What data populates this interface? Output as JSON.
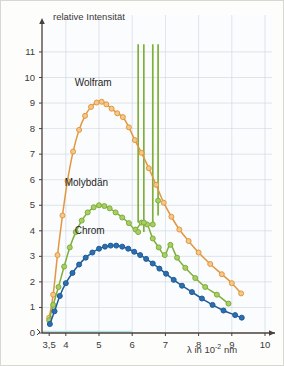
{
  "figure": {
    "background_color": "#fdfdfb",
    "border_color": "#d8d8d2"
  },
  "axes": {
    "y_title": "relative Intensität",
    "x_title_prefix": "λ in 10",
    "x_title_exponent": "-2",
    "x_title_suffix": "nm",
    "y_ticks": [
      "0",
      "1",
      "2",
      "3",
      "4",
      "5",
      "6",
      "7",
      "8",
      "9",
      "10",
      "11"
    ],
    "x_ticks": [
      "3,5",
      "4",
      "5",
      "6",
      "7",
      "8",
      "9",
      "10"
    ],
    "axis_color": "#4a3f3a",
    "grid_color": "#c9d6e0",
    "baseline_color": "#aee6e6"
  },
  "chart_data": {
    "type": "line",
    "title": "",
    "xlabel": "λ in 10^-2 nm",
    "ylabel": "relative Intensität",
    "xlim": [
      3.2,
      10.3
    ],
    "ylim": [
      0,
      11.3
    ],
    "grid": true,
    "legend": "inline-annotations",
    "annotations": [
      {
        "text": "Wolfram",
        "x": 5.05,
        "y": 9.75,
        "color": "#1f1f1f"
      },
      {
        "text": "Molybdän",
        "x": 4.75,
        "y": 5.85,
        "color": "#1f1f1f"
      },
      {
        "text": "Chrom",
        "x": 5.05,
        "y": 3.95,
        "color": "#1f1f1f"
      }
    ],
    "series": [
      {
        "name": "Wolfram",
        "color": "#e2973f",
        "marker": "circle",
        "marker_fill": "#f4c88a",
        "x": [
          3.5,
          3.62,
          3.75,
          3.9,
          4.05,
          4.22,
          4.4,
          4.58,
          4.76,
          4.93,
          5.08,
          5.22,
          5.38,
          5.55,
          5.72,
          5.9,
          6.08,
          6.28,
          6.5,
          6.72,
          6.95,
          7.18,
          7.42,
          7.7,
          8.0,
          8.35,
          8.7,
          9.0,
          9.28
        ],
        "y": [
          0.6,
          1.5,
          3.05,
          4.6,
          5.95,
          7.1,
          7.95,
          8.5,
          8.85,
          9.02,
          9.05,
          8.95,
          8.78,
          8.6,
          8.45,
          8.05,
          7.55,
          7.05,
          6.45,
          5.8,
          5.1,
          4.55,
          4.05,
          3.6,
          3.15,
          2.7,
          2.3,
          1.95,
          1.55
        ]
      },
      {
        "name": "Molybdän",
        "color": "#7fae3a",
        "marker": "circle",
        "marker_fill": "#a8cf63",
        "x": [
          3.5,
          3.62,
          3.78,
          3.95,
          4.12,
          4.3,
          4.48,
          4.66,
          4.84,
          5.0,
          5.16,
          5.32,
          5.5,
          5.7,
          5.9,
          6.1,
          6.28,
          6.45,
          6.62,
          6.8,
          6.98,
          7.15,
          7.35,
          7.6,
          7.9,
          8.2,
          8.55,
          8.9
        ],
        "y": [
          0.5,
          1.1,
          1.8,
          2.6,
          3.35,
          3.95,
          4.4,
          4.72,
          4.92,
          5.0,
          4.97,
          4.88,
          4.72,
          4.52,
          4.3,
          4.05,
          4.32,
          4.25,
          3.7,
          3.35,
          3.05,
          3.45,
          2.95,
          2.55,
          2.15,
          1.8,
          1.5,
          1.15
        ]
      },
      {
        "name": "Chrom",
        "color": "#1f5c99",
        "marker": "circle",
        "marker_fill": "#2c6fae",
        "x": [
          3.52,
          3.66,
          3.82,
          4.0,
          4.2,
          4.4,
          4.6,
          4.8,
          5.0,
          5.18,
          5.35,
          5.52,
          5.7,
          5.88,
          6.06,
          6.24,
          6.42,
          6.62,
          6.82,
          7.02,
          7.25,
          7.5,
          7.8,
          8.1,
          8.42,
          8.75,
          9.1,
          9.3
        ],
        "y": [
          0.35,
          0.85,
          1.45,
          1.95,
          2.35,
          2.68,
          2.95,
          3.15,
          3.3,
          3.38,
          3.42,
          3.42,
          3.38,
          3.3,
          3.18,
          3.05,
          2.9,
          2.72,
          2.52,
          2.32,
          2.08,
          1.85,
          1.6,
          1.35,
          1.1,
          0.88,
          0.7,
          0.6
        ]
      }
    ],
    "characteristic_lines": {
      "name": "Molybdän characteristic peaks",
      "color": "#7fae3a",
      "x": [
        6.18,
        6.35,
        6.62,
        6.78
      ],
      "top_y": 11.3,
      "base_y": [
        4.32,
        3.95,
        4.25,
        4.6
      ],
      "peak_markers": [
        {
          "x": 6.35,
          "y": 4.32
        },
        {
          "x": 6.62,
          "y": 4.25
        },
        {
          "x": 6.78,
          "y": 5.18
        },
        {
          "x": 6.18,
          "y": 3.95
        }
      ]
    }
  }
}
